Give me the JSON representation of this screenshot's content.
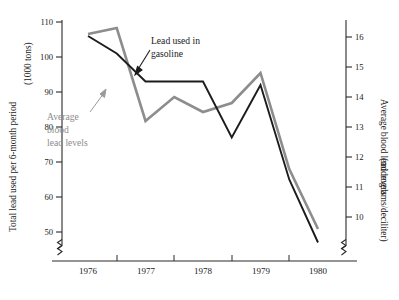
{
  "chart_data": {
    "type": "line",
    "title": "",
    "xlabel": "",
    "grid": false,
    "legend_position": "inline-annotations",
    "x_axis": {
      "tick_labels": [
        "1976",
        "1977",
        "1978",
        "1979",
        "1980"
      ],
      "minor_ticks_between": true,
      "axis_break": true
    },
    "left_axis": {
      "label_line1": "Total lead used per 6-month period",
      "label_line2": "(1000 tons)",
      "tick_labels": [
        "110",
        "100",
        "90",
        "80",
        "70",
        "60",
        "50"
      ],
      "ylim": [
        50,
        110
      ],
      "axis_break": true
    },
    "right_axis": {
      "label_line1": "Average blood lead levels",
      "label_line2": "(micrograms/deciliter)",
      "tick_labels": [
        "16",
        "15",
        "14",
        "13",
        "12",
        "11",
        "10"
      ],
      "ylim": [
        9.4,
        16.6
      ],
      "axis_break": true
    },
    "series": [
      {
        "name": "Lead used in gasoline",
        "axis": "left",
        "color": "#1c1c1c",
        "units": "1000 tons",
        "x": [
          "1976.0",
          "1976.5",
          "1977.0",
          "1977.5",
          "1978.0",
          "1978.5",
          "1979.0",
          "1979.5",
          "1980.0"
        ],
        "values": [
          106,
          101,
          93,
          93,
          93,
          77,
          92,
          65,
          47
        ]
      },
      {
        "name": "Average blood lead levels",
        "axis": "right",
        "color": "#8d8d8d",
        "units": "micrograms/deciliter",
        "x": [
          "1976.0",
          "1976.5",
          "1977.0",
          "1977.5",
          "1978.0",
          "1978.5",
          "1979.0",
          "1979.5",
          "1980.0"
        ],
        "values": [
          16.1,
          16.3,
          13.2,
          14.0,
          13.5,
          13.8,
          14.8,
          11.6,
          9.6
        ]
      }
    ],
    "annotations": [
      {
        "text_line1": "Lead used in",
        "text_line2": "gasoline",
        "color": "#1a1a1a",
        "points_to": "black-series"
      },
      {
        "text_line1": "Average",
        "text_line2": "blood",
        "text_line3": "lead levels",
        "color": "#8d8d8d",
        "points_to": "gray-series"
      }
    ]
  },
  "colors": {
    "lead_gasoline": "#1c1c1c",
    "blood_lead": "#8d8d8d",
    "axis": "#2a2a2a",
    "background": "#ffffff"
  }
}
